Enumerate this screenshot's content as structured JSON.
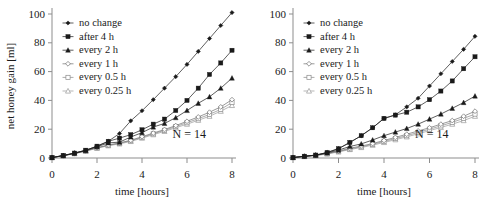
{
  "figure": {
    "panels": [
      {
        "id": "left",
        "annotation": "N = 14",
        "xaxis": {
          "label": "time [hours]",
          "ticks": [
            "0",
            "2",
            "4",
            "6",
            "8"
          ],
          "min": 0,
          "max": 8
        },
        "yaxis": {
          "label": "net honey gain [ml]",
          "ticks": [
            "0",
            "20",
            "40",
            "60",
            "80",
            "100"
          ],
          "min": 0,
          "max": 100,
          "visible": true
        }
      },
      {
        "id": "right",
        "annotation": "N = 14",
        "xaxis": {
          "label": "time [hours]",
          "ticks": [
            "0",
            "2",
            "4",
            "6",
            "8"
          ],
          "min": 0,
          "max": 8
        },
        "yaxis": {
          "label": "",
          "ticks": [
            "0",
            "20",
            "40",
            "60",
            "80",
            "100"
          ],
          "min": 0,
          "max": 100,
          "visible": false
        }
      }
    ],
    "legend": [
      {
        "label": "no change",
        "marker": "diamond-filled",
        "color": "#1a1a1a"
      },
      {
        "label": "after  4 h",
        "marker": "square-filled",
        "color": "#1a1a1a"
      },
      {
        "label": "every 2 h",
        "marker": "triangle-filled",
        "color": "#1a1a1a"
      },
      {
        "label": "every 1 h",
        "marker": "diamond-open",
        "color": "#6f6f6f"
      },
      {
        "label": "every 0.5 h",
        "marker": "square-open",
        "color": "#8a8a8a"
      },
      {
        "label": "every 0.25 h",
        "marker": "triangle-open",
        "color": "#9a9a9a"
      }
    ]
  },
  "chart_data": [
    {
      "type": "line",
      "panel": "left",
      "title": "",
      "xlabel": "time [hours]",
      "ylabel": "net honey gain [ml]",
      "xlim": [
        0,
        8
      ],
      "ylim": [
        0,
        100
      ],
      "xticks": [
        0,
        2,
        4,
        6,
        8
      ],
      "yticks": [
        0,
        20,
        40,
        60,
        80,
        100
      ],
      "grid": false,
      "legend_position": "upper-left-inside",
      "annotations": [
        {
          "text": "N = 14",
          "x": 6.1,
          "y": 14
        }
      ],
      "x": [
        0,
        0.5,
        1,
        1.5,
        2,
        2.5,
        3,
        3.5,
        4,
        4.5,
        5,
        5.5,
        6,
        6.5,
        7,
        7.5,
        8
      ],
      "series": [
        {
          "name": "no change",
          "marker": "diamond-filled",
          "color": "#1a1a1a",
          "values": [
            0.3,
            1.7,
            3.4,
            5.4,
            8.2,
            11.6,
            17.0,
            25.8,
            32.8,
            40.5,
            48.5,
            56.5,
            65.0,
            74.0,
            83.0,
            92.0,
            101.0
          ]
        },
        {
          "name": "after  4 h",
          "marker": "square-filled",
          "color": "#1a1a1a",
          "values": [
            0.3,
            1.7,
            3.4,
            5.4,
            8.2,
            11.6,
            13.8,
            16.2,
            19.6,
            23.5,
            27.0,
            33.0,
            40.0,
            48.5,
            58.0,
            66.0,
            74.8
          ]
        },
        {
          "name": "every 2 h",
          "marker": "triangle-filled",
          "color": "#1a1a1a",
          "values": [
            0.3,
            1.7,
            3.4,
            5.2,
            7.8,
            10.5,
            11.0,
            14.6,
            17.6,
            21.5,
            24.0,
            28.0,
            33.0,
            38.0,
            42.5,
            48.5,
            55.5
          ]
        },
        {
          "name": "every 1 h",
          "marker": "diamond-open",
          "color": "#6f6f6f",
          "values": [
            0.3,
            1.6,
            3.2,
            5.0,
            7.2,
            9.0,
            10.5,
            12.3,
            14.8,
            17.3,
            19.8,
            22.5,
            25.5,
            28.5,
            31.8,
            35.5,
            40.5
          ]
        },
        {
          "name": "every 0.5 h",
          "marker": "square-open",
          "color": "#8a8a8a",
          "values": [
            0.3,
            1.6,
            3.1,
            4.9,
            7.0,
            8.8,
            10.2,
            12.0,
            14.3,
            16.8,
            19.2,
            21.8,
            24.5,
            27.3,
            30.3,
            33.8,
            38.5
          ]
        },
        {
          "name": "every 0.25 h",
          "marker": "triangle-open",
          "color": "#9a9a9a",
          "values": [
            0.3,
            1.5,
            3.0,
            4.7,
            6.8,
            8.5,
            9.8,
            11.5,
            13.8,
            16.2,
            18.5,
            21.0,
            23.5,
            26.2,
            29.0,
            32.5,
            36.5
          ]
        }
      ]
    },
    {
      "type": "line",
      "panel": "right",
      "title": "",
      "xlabel": "time [hours]",
      "ylabel": "",
      "xlim": [
        0,
        8
      ],
      "ylim": [
        0,
        100
      ],
      "xticks": [
        0,
        2,
        4,
        6,
        8
      ],
      "yticks": [
        0,
        20,
        40,
        60,
        80,
        100
      ],
      "grid": false,
      "legend_position": "upper-left-inside",
      "annotations": [
        {
          "text": "N = 14",
          "x": 6.1,
          "y": 14
        }
      ],
      "x": [
        0,
        0.5,
        1,
        1.5,
        2,
        2.5,
        3,
        3.5,
        4,
        4.5,
        5,
        5.5,
        6,
        6.5,
        7,
        7.5,
        8
      ],
      "series": [
        {
          "name": "no change",
          "marker": "diamond-filled",
          "color": "#1a1a1a",
          "values": [
            0.3,
            1.2,
            2.0,
            3.8,
            6.5,
            10.8,
            15.5,
            21.0,
            27.5,
            30.0,
            35.5,
            41.5,
            50.0,
            58.5,
            67.0,
            75.5,
            84.5
          ]
        },
        {
          "name": "after  4 h",
          "marker": "square-filled",
          "color": "#1a1a1a",
          "values": [
            0.3,
            1.2,
            2.0,
            3.8,
            6.5,
            10.8,
            15.5,
            21.0,
            27.5,
            29.8,
            31.8,
            35.5,
            40.5,
            46.5,
            53.5,
            62.0,
            70.3
          ]
        },
        {
          "name": "every 2 h",
          "marker": "triangle-filled",
          "color": "#1a1a1a",
          "values": [
            0.3,
            1.2,
            2.0,
            3.5,
            5.5,
            8.0,
            9.8,
            12.5,
            15.5,
            18.0,
            20.5,
            23.5,
            27.0,
            30.5,
            34.5,
            38.5,
            43.0
          ]
        },
        {
          "name": "every 1 h",
          "marker": "diamond-open",
          "color": "#6f6f6f",
          "values": [
            0.3,
            1.1,
            1.9,
            3.2,
            4.8,
            6.8,
            8.3,
            10.0,
            12.2,
            14.3,
            16.5,
            18.8,
            21.0,
            23.5,
            26.0,
            29.0,
            32.5
          ]
        },
        {
          "name": "every 0.5 h",
          "marker": "square-open",
          "color": "#8a8a8a",
          "values": [
            0.3,
            1.1,
            1.8,
            3.0,
            4.5,
            6.3,
            7.8,
            9.5,
            11.5,
            13.5,
            15.5,
            17.8,
            20.0,
            22.3,
            24.8,
            27.5,
            30.5
          ]
        },
        {
          "name": "every 0.25 h",
          "marker": "triangle-open",
          "color": "#9a9a9a",
          "values": [
            0.3,
            1.0,
            1.7,
            2.8,
            4.2,
            5.9,
            7.3,
            8.9,
            10.8,
            12.7,
            14.7,
            16.8,
            19.0,
            21.2,
            23.5,
            26.0,
            29.0
          ]
        }
      ]
    }
  ]
}
